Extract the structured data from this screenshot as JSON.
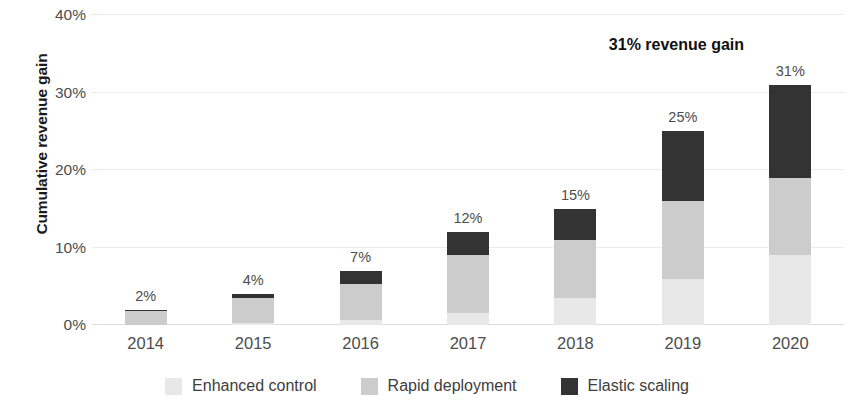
{
  "chart_data": {
    "type": "bar",
    "stacked": true,
    "title": "",
    "xlabel": "",
    "ylabel": "Cumulative revenue gain",
    "categories": [
      "2014",
      "2015",
      "2016",
      "2017",
      "2018",
      "2019",
      "2020"
    ],
    "ylim": [
      0,
      40
    ],
    "ytick_values": [
      0,
      10,
      20,
      30,
      40
    ],
    "ytick_labels": [
      "0%",
      "10%",
      "20%",
      "30%",
      "40%"
    ],
    "grid": true,
    "legend_position": "bottom",
    "value_suffix": "%",
    "series": [
      {
        "name": "Enhanced control",
        "color": "#e8e8e8",
        "values": [
          0.0,
          0.3,
          0.7,
          1.5,
          3.5,
          6.0,
          9.0
        ]
      },
      {
        "name": "Rapid deployment",
        "color": "#cccccc",
        "values": [
          1.8,
          3.2,
          4.6,
          7.5,
          7.5,
          10.0,
          10.0
        ]
      },
      {
        "name": "Elastic scaling",
        "color": "#333333",
        "values": [
          0.2,
          0.5,
          1.7,
          3.0,
          4.0,
          9.0,
          12.0
        ]
      }
    ],
    "totals": [
      2,
      4,
      7,
      12,
      15,
      25,
      31
    ],
    "total_labels": [
      "2%",
      "4%",
      "7%",
      "12%",
      "15%",
      "25%",
      "31%"
    ],
    "annotations": [
      {
        "text": "31% revenue gain",
        "x_category": "2019",
        "y_value": 36
      }
    ]
  },
  "legend": {
    "items": [
      {
        "label": "Enhanced control",
        "color": "#e8e8e8"
      },
      {
        "label": "Rapid deployment",
        "color": "#cccccc"
      },
      {
        "label": "Elastic scaling",
        "color": "#333333"
      }
    ]
  }
}
